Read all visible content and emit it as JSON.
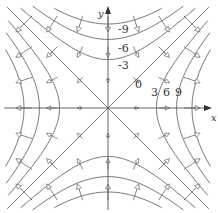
{
  "figure": {
    "axes": {
      "x_label": "x",
      "y_label": "y"
    },
    "level_labels": [
      "-9",
      "-6",
      "-3",
      "0",
      "3",
      "6",
      "9"
    ],
    "levels": [
      -9,
      -6,
      -3,
      0,
      3,
      6,
      9
    ],
    "colors": {
      "curve": "#6a6a6a",
      "axis": "#555555",
      "text": "#333333"
    }
  }
}
